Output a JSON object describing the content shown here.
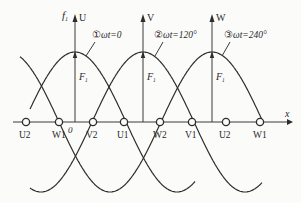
{
  "figure": {
    "y_axis_label": "f",
    "y_axis_subscript": "1",
    "x_axis_label": "x",
    "origin_label": "0",
    "phase_axes": [
      {
        "label": "U",
        "x": 75
      },
      {
        "label": "V",
        "x": 143
      },
      {
        "label": "W",
        "x": 212
      }
    ],
    "peak_vectors": [
      {
        "label": "F",
        "subscript": "1",
        "x": 75
      },
      {
        "label": "F",
        "subscript": "1",
        "x": 143
      },
      {
        "label": "F",
        "subscript": "1",
        "x": 212
      }
    ],
    "annotations": [
      {
        "marker": "①",
        "text": "ωt=0"
      },
      {
        "marker": "②",
        "text": "ωt=120°"
      },
      {
        "marker": "③",
        "text": "ωt=240°"
      }
    ],
    "slots": [
      {
        "label": "U2",
        "x": 26
      },
      {
        "label": "W1",
        "x": 59
      },
      {
        "label": "V2",
        "x": 93
      },
      {
        "label": "U1",
        "x": 124
      },
      {
        "label": "W2",
        "x": 160
      },
      {
        "label": "V1",
        "x": 192
      },
      {
        "label": "U2",
        "x": 226
      },
      {
        "label": "W1",
        "x": 260
      }
    ],
    "colors": {
      "line": "#2d2d2d",
      "background": "#fbfbfa"
    }
  }
}
